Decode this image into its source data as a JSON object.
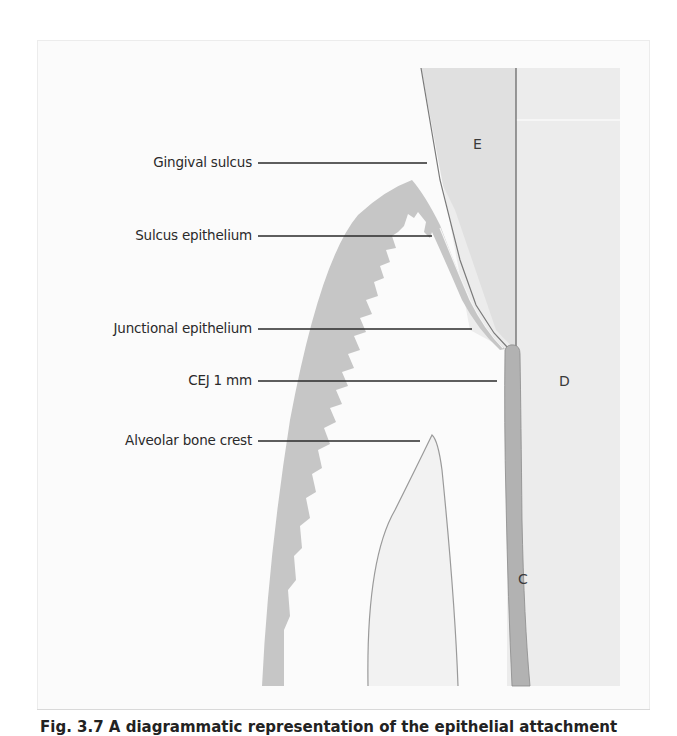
{
  "figure": {
    "caption": "Fig. 3.7 A diagrammatic representation of the epithelial attachment",
    "labels": [
      {
        "id": "gingival-sulcus",
        "text": "Gingival sulcus"
      },
      {
        "id": "sulcus-epithelium",
        "text": "Sulcus epithelium"
      },
      {
        "id": "junctional-epithelium",
        "text": "Junctional epithelium"
      },
      {
        "id": "cej",
        "text": "CEJ 1 mm"
      },
      {
        "id": "alveolar-bone-crest",
        "text": "Alveolar bone crest"
      }
    ],
    "tissue_letters": {
      "enamel": "E",
      "dentin": "D",
      "cementum": "C"
    },
    "colors": {
      "background": "#ffffff",
      "panel": "#fbfbfb",
      "tooth_gray": "#ececec",
      "enamel_gray": "#e2e2e2",
      "gingiva_epithelium": "#c4c4c4",
      "cementum": "#b0b0b0",
      "outline": "#7a7a7a",
      "leader_line": "#2a2a2a"
    }
  }
}
